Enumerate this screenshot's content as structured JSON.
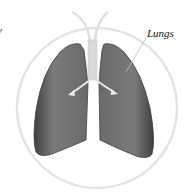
{
  "diagram": {
    "labels": {
      "left_partial": "y",
      "lungs": "Lungs"
    },
    "colors": {
      "lung_fill": "#6e6e6e",
      "lung_dark": "#4a4a4a",
      "airway": "#d8d8d8",
      "circle": "#e6e6e6"
    },
    "icons": [
      "lungs-illustration",
      "trachea",
      "bronchi-arrow-left",
      "bronchi-arrow-right",
      "pointer-line"
    ]
  }
}
